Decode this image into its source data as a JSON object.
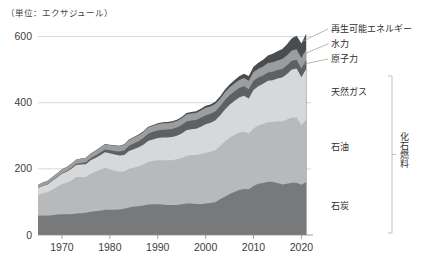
{
  "figure": {
    "unit_note": "（単位：エクサジュール）",
    "group_bracket_label": "化石燃料"
  },
  "chart_data": {
    "type": "area",
    "stacked": true,
    "title": "",
    "subtitle": "",
    "xlabel": "",
    "ylabel": "",
    "unit": "エクサジュール",
    "grid": "horizontal-only",
    "legend_position": "right-inline-labels",
    "xlim": [
      1965,
      2022
    ],
    "ylim": [
      0,
      650
    ],
    "yticks": [
      0,
      200,
      400,
      600
    ],
    "ytick_labels": [
      "0",
      "200",
      "400",
      "600"
    ],
    "xticks": [
      1970,
      1980,
      1990,
      2000,
      2010,
      2020
    ],
    "xtick_labels": [
      "1970",
      "1980",
      "1990",
      "2000",
      "2010",
      "2020"
    ],
    "x": [
      1965,
      1966,
      1967,
      1968,
      1969,
      1970,
      1971,
      1972,
      1973,
      1974,
      1975,
      1976,
      1977,
      1978,
      1979,
      1980,
      1981,
      1982,
      1983,
      1984,
      1985,
      1986,
      1987,
      1988,
      1989,
      1990,
      1991,
      1992,
      1993,
      1994,
      1995,
      1996,
      1997,
      1998,
      1999,
      2000,
      2001,
      2002,
      2003,
      2004,
      2005,
      2006,
      2007,
      2008,
      2009,
      2010,
      2011,
      2012,
      2013,
      2014,
      2015,
      2016,
      2017,
      2018,
      2019,
      2020,
      2021
    ],
    "series": [
      {
        "name": "石炭",
        "label": "石炭",
        "color": "#77797b",
        "values": [
          58,
          59,
          58,
          60,
          62,
          63,
          63,
          63,
          65,
          66,
          67,
          70,
          72,
          73,
          76,
          76,
          76,
          77,
          79,
          83,
          86,
          87,
          89,
          92,
          93,
          93,
          92,
          91,
          91,
          91,
          93,
          95,
          95,
          94,
          93,
          95,
          97,
          99,
          108,
          116,
          124,
          130,
          136,
          139,
          138,
          148,
          155,
          157,
          161,
          160,
          157,
          153,
          155,
          158,
          158,
          152,
          160
        ]
      },
      {
        "name": "石油",
        "label": "石油",
        "color": "#b7b9bb",
        "values": [
          62,
          67,
          71,
          77,
          84,
          91,
          95,
          102,
          110,
          109,
          108,
          115,
          119,
          124,
          127,
          123,
          118,
          114,
          113,
          117,
          117,
          121,
          124,
          129,
          131,
          133,
          134,
          135,
          135,
          138,
          140,
          144,
          147,
          148,
          152,
          154,
          155,
          157,
          160,
          167,
          170,
          172,
          174,
          173,
          169,
          174,
          176,
          178,
          180,
          182,
          187,
          190,
          194,
          197,
          197,
          180,
          189
        ]
      },
      {
        "name": "天然ガス",
        "label": "天然ガス",
        "color": "#d6d8d9",
        "values": [
          21,
          22,
          24,
          26,
          28,
          31,
          33,
          35,
          37,
          38,
          39,
          41,
          42,
          44,
          47,
          48,
          49,
          49,
          50,
          54,
          56,
          57,
          60,
          63,
          65,
          67,
          69,
          69,
          70,
          71,
          74,
          78,
          78,
          79,
          82,
          86,
          87,
          90,
          93,
          96,
          100,
          103,
          106,
          109,
          106,
          116,
          119,
          122,
          125,
          126,
          129,
          133,
          138,
          145,
          148,
          145,
          153
        ]
      },
      {
        "name": "原子力",
        "label": "原子力",
        "color": "#5e6164",
        "values": [
          0.5,
          0.7,
          0.9,
          1.1,
          1.4,
          1.8,
          2.3,
          3.0,
          3.6,
          4.3,
          5.6,
          6.1,
          7.4,
          8.3,
          8.5,
          9.2,
          11.1,
          12.2,
          13.6,
          16.0,
          17.9,
          18.8,
          20.4,
          22.2,
          22.9,
          23.0,
          23.5,
          23.8,
          24.5,
          24.7,
          25.5,
          26.3,
          26.1,
          26.4,
          27.3,
          27.2,
          27.3,
          27.7,
          27.6,
          28.4,
          28.5,
          28.6,
          28.4,
          28.4,
          27.8,
          28.1,
          26.1,
          24.9,
          25.2,
          25.4,
          25.6,
          25.9,
          26.0,
          26.8,
          27.1,
          26.0,
          27.0
        ]
      },
      {
        "name": "水力",
        "label": "水力",
        "color": "#9b9d9f",
        "values": [
          9.5,
          10.0,
          10.2,
          10.8,
          11.2,
          11.8,
          12.1,
          12.5,
          12.6,
          13.4,
          13.6,
          13.7,
          14.3,
          15.0,
          15.4,
          15.8,
          16.1,
          16.4,
          17.0,
          17.4,
          17.6,
          17.9,
          18.0,
          18.5,
          18.4,
          19.0,
          19.3,
          19.2,
          19.9,
          20.1,
          20.6,
          21.0,
          21.2,
          21.6,
          21.9,
          22.3,
          22.0,
          22.4,
          22.4,
          23.3,
          23.8,
          24.3,
          24.5,
          25.3,
          25.6,
          26.6,
          26.6,
          27.5,
          28.6,
          29.0,
          29.2,
          30.2,
          30.4,
          31.0,
          31.5,
          32.3,
          32.1
        ]
      },
      {
        "name": "再生可能エネルギー",
        "label": "再生可能エネルギー",
        "color": "#4a4d50",
        "values": [
          0.2,
          0.2,
          0.2,
          0.3,
          0.3,
          0.3,
          0.4,
          0.4,
          0.4,
          0.5,
          0.5,
          0.6,
          0.7,
          0.8,
          0.9,
          1.0,
          1.1,
          1.2,
          1.4,
          1.6,
          1.8,
          2.0,
          2.2,
          2.4,
          2.6,
          2.9,
          3.1,
          3.3,
          3.5,
          3.7,
          4.0,
          4.3,
          4.6,
          5.0,
          5.4,
          5.9,
          6.3,
          6.8,
          7.4,
          8.1,
          9.0,
          10.1,
          11.4,
          12.9,
          14.2,
          16.0,
          18.3,
          20.4,
          22.8,
          25.3,
          27.6,
          30.2,
          33.4,
          37.0,
          40.6,
          43.4,
          48.0
        ]
      }
    ],
    "callout_labels": [
      {
        "text": "再生可能エネルギー",
        "series": "再生可能エネルギー"
      },
      {
        "text": "水力",
        "series": "水力"
      },
      {
        "text": "原子力",
        "series": "原子力"
      }
    ],
    "inline_labels": [
      {
        "text": "天然ガス",
        "series": "天然ガス"
      },
      {
        "text": "石油",
        "series": "石油"
      },
      {
        "text": "石炭",
        "series": "石炭"
      }
    ]
  }
}
